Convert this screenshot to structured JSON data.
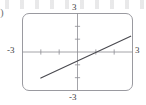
{
  "figure": {
    "part_label": ")",
    "caption": "",
    "frame": {
      "rounded": true,
      "border_color": "#9a9aa0"
    }
  },
  "labels": {
    "top": "3",
    "bottom": "-3",
    "left": "-3",
    "right": "3"
  },
  "chart_data": {
    "type": "line",
    "title": "",
    "xlabel": "",
    "ylabel": "",
    "xlim": [
      -3,
      3
    ],
    "ylim": [
      -3,
      3
    ],
    "xticks": [
      -3,
      -2,
      -1,
      0,
      1,
      2,
      3
    ],
    "yticks": [
      -3,
      -2,
      -1,
      0,
      1,
      2,
      3
    ],
    "xtick_labels": [
      "-3",
      "",
      "",
      "",
      "",
      "",
      "3"
    ],
    "ytick_labels": [
      "-3",
      "",
      "",
      "",
      "",
      "",
      "3"
    ],
    "grid": false,
    "legend": "none",
    "axes": {
      "x_axis_at_y": 0,
      "y_axis_at_x": 0,
      "arrows": false
    },
    "series": [
      {
        "name": "line",
        "equation": "y = (2/3)x - 0.7",
        "slope": 0.667,
        "intercept": -0.7,
        "x_intercept": 1.05,
        "x": [
          -2.0,
          2.9
        ],
        "y": [
          -2.03,
          1.23
        ],
        "color": "#4a4a50",
        "style": "solid"
      }
    ]
  }
}
